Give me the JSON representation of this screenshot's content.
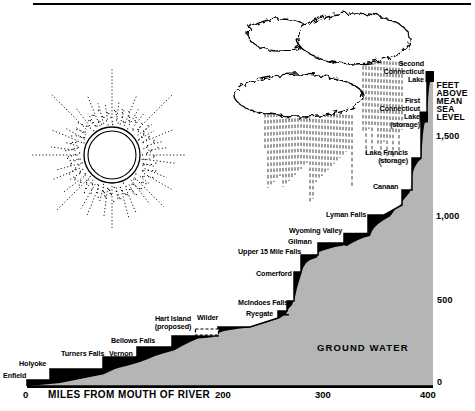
{
  "axes": {
    "x": {
      "title": "MILES FROM MOUTH OF RIVER",
      "ticks": [
        "0",
        "200",
        "300",
        "400"
      ]
    },
    "y": {
      "title": "FEET\nABOVE\nMEAN\nSEA\nLEVEL",
      "ticks": [
        "1,500",
        "1,000",
        "500",
        "0"
      ]
    }
  },
  "area_label": "GROUND WATER",
  "places": {
    "enfield": "Enfield",
    "holyoke": "Holyoke",
    "turners_falls": "Turners Falls",
    "vernon": "Vernon",
    "bellows_falls": "Bellows Falls",
    "hart_island": "Hart Island\n(proposed)",
    "wilder": "Wilder",
    "mcindoes_falls": "McIndoes Falls",
    "ryegate": "Ryegate",
    "comerford": "Comerford",
    "upper_15_mile_falls": "Upper 15 Mile Falls",
    "gilman": "Gilman",
    "wyoming_valley": "Wyoming Valley",
    "lyman_falls": "Lyman Falls",
    "canaan": "Canaan",
    "lake_francis": "Lake Francis\n(storage)",
    "first_connecticut_lake": "First\nConnecticut\nLake\n(storage)",
    "second_connecticut_lake": "Second\nConnecticut\nLake"
  },
  "colors": {
    "ground": "#b4b6b5",
    "ink": "#000000"
  },
  "chart_data": {
    "type": "area",
    "title": "",
    "xlabel": "MILES FROM MOUTH OF RIVER",
    "ylabel": "FEET ABOVE MEAN SEA LEVEL",
    "xlim": [
      0,
      400
    ],
    "ylim": [
      0,
      1900
    ],
    "x_ticks": [
      0,
      200,
      300,
      400
    ],
    "y_ticks": [
      0,
      500,
      1000,
      1500
    ],
    "legend": false,
    "grid": false,
    "points": [
      {
        "name": "Enfield",
        "mile": 5,
        "elevation_ft": 30
      },
      {
        "name": "Holyoke",
        "mile": 23,
        "elevation_ft": 100
      },
      {
        "name": "Turners Falls",
        "mile": 75,
        "elevation_ft": 170
      },
      {
        "name": "Vernon",
        "mile": 110,
        "elevation_ft": 235
      },
      {
        "name": "Bellows Falls",
        "mile": 145,
        "elevation_ft": 300
      },
      {
        "name": "Hart Island (proposed)",
        "mile": 168,
        "elevation_ft": 340
      },
      {
        "name": "Wilder",
        "mile": 190,
        "elevation_ft": 355
      },
      {
        "name": "Ryegate",
        "mile": 250,
        "elevation_ft": 455
      },
      {
        "name": "McIndoes Falls",
        "mile": 258,
        "elevation_ft": 515
      },
      {
        "name": "Comerford",
        "mile": 265,
        "elevation_ft": 690
      },
      {
        "name": "Upper 15 Mile Falls",
        "mile": 272,
        "elevation_ft": 795
      },
      {
        "name": "Gilman",
        "mile": 290,
        "elevation_ft": 875
      },
      {
        "name": "Wyoming Valley",
        "mile": 315,
        "elevation_ft": 930
      },
      {
        "name": "Lyman Falls",
        "mile": 342,
        "elevation_ft": 1040
      },
      {
        "name": "Canaan",
        "mile": 368,
        "elevation_ft": 1200
      },
      {
        "name": "Lake Francis (storage)",
        "mile": 380,
        "elevation_ft": 1390
      },
      {
        "name": "First Connecticut Lake (storage)",
        "mile": 392,
        "elevation_ft": 1665
      },
      {
        "name": "Second Connecticut Lake",
        "mile": 398,
        "elevation_ft": 1890
      }
    ]
  }
}
